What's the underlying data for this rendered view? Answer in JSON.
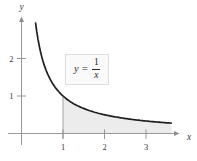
{
  "figure": {
    "equation_label": {
      "lhs": "y =",
      "numerator": "1",
      "denominator": "x"
    }
  },
  "chart_data": {
    "type": "area",
    "title": "",
    "function": "y = 1/x",
    "xlabel": "x",
    "ylabel": "y",
    "xlim": [
      -0.3,
      4.1
    ],
    "ylim": [
      -0.35,
      3.1
    ],
    "grid": false,
    "legend": "none",
    "x_ticks": [
      1,
      2,
      3
    ],
    "y_ticks": [
      1,
      2
    ],
    "curve_domain_x": [
      0.34,
      3.63
    ],
    "shaded_region": {
      "from_x": 1,
      "to_x": 3.63,
      "lower_bound": "x-axis",
      "upper_bound": "curve"
    },
    "series": [
      {
        "name": "y = 1/x",
        "x": [
          0.34,
          0.4,
          0.5,
          0.6,
          0.8,
          1.0,
          1.25,
          1.5,
          2.0,
          2.5,
          3.0,
          3.5,
          3.63
        ],
        "y": [
          2.94,
          2.5,
          2.0,
          1.67,
          1.25,
          1.0,
          0.8,
          0.67,
          0.5,
          0.4,
          0.33,
          0.29,
          0.28
        ]
      }
    ],
    "colors": {
      "curve": "#1f1f1f",
      "axis": "#8c8c8c",
      "shade": "#ececec",
      "boundary_line": "#9b9b9b",
      "text": "#3a3a3a"
    }
  }
}
